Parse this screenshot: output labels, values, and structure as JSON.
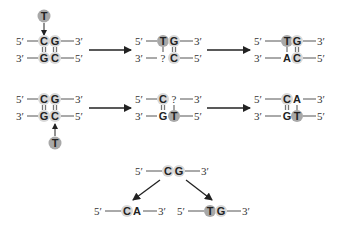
{
  "colors": {
    "circle_light": "#d8d8d8",
    "circle_dark": "#a8a8a8",
    "line": "#555555",
    "arrow": "#222222"
  },
  "labels": {
    "five": "5′",
    "three": "3′",
    "unknown": "?"
  },
  "row1": {
    "panelA": {
      "top": [
        "C",
        "G"
      ],
      "bottom": [
        "G",
        "C"
      ],
      "incoming": "T"
    },
    "panelB": {
      "top": [
        "T",
        "G"
      ],
      "bottom": [
        "?",
        "C"
      ]
    },
    "panelC": {
      "top": [
        "T",
        "G"
      ],
      "bottom": [
        "A",
        "C"
      ]
    }
  },
  "row2": {
    "panelA": {
      "top": [
        "C",
        "G"
      ],
      "bottom": [
        "G",
        "C"
      ],
      "incoming": "T"
    },
    "panelB": {
      "top": [
        "C",
        "?"
      ],
      "bottom": [
        "G",
        "T"
      ]
    },
    "panelC": {
      "top": [
        "C",
        "A"
      ],
      "bottom": [
        "G",
        "T"
      ]
    }
  },
  "row3": {
    "parent": [
      "C",
      "G"
    ],
    "left": [
      "C",
      "A"
    ],
    "right": [
      "T",
      "G"
    ]
  }
}
